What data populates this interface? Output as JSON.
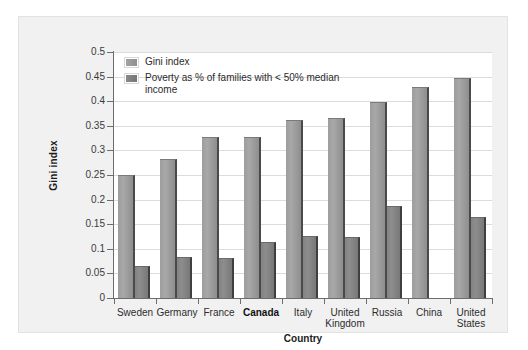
{
  "chart_data": {
    "type": "bar",
    "title": "",
    "xlabel": "Country",
    "ylabel": "Gini index",
    "ylim": [
      0,
      0.5
    ],
    "yticks": [
      "0",
      "0.05",
      "0.1",
      "0.15",
      "0.2",
      "0.25",
      "0.3",
      "0.35",
      "0.4",
      "0.45",
      "0.5"
    ],
    "ytick_values": [
      0,
      0.05,
      0.1,
      0.15,
      0.2,
      0.25,
      0.3,
      0.35,
      0.4,
      0.45,
      0.5
    ],
    "grid": true,
    "legend_position": "top-left",
    "categories": [
      "Sweden",
      "Germany",
      "France",
      "Canada",
      "Italy",
      "United Kingdom",
      "Russia",
      "China",
      "United States"
    ],
    "highlighted_category": "Canada",
    "series": [
      {
        "name": "Gini index",
        "color": "#9a9a9a",
        "values": [
          0.249,
          0.283,
          0.327,
          0.328,
          0.361,
          0.365,
          0.399,
          0.429,
          0.447
        ]
      },
      {
        "name": "Poverty as % of families with < 50% median income",
        "color": "#7f7f7f",
        "values": [
          0.065,
          0.084,
          0.081,
          0.113,
          0.126,
          0.124,
          0.186,
          null,
          0.165
        ]
      }
    ]
  },
  "legend": {
    "items": [
      {
        "label": "Gini index",
        "swatch": "gini"
      },
      {
        "label": "Poverty as % of families with < 50% median income",
        "swatch": "poverty"
      }
    ]
  }
}
